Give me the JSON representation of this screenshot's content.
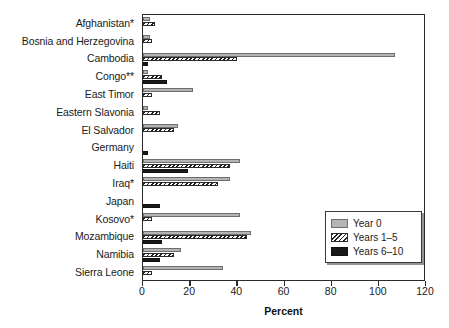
{
  "chart_data": {
    "type": "bar",
    "orientation": "horizontal",
    "title": "",
    "xlabel": "Percent",
    "ylabel": "",
    "xlim": [
      0,
      120
    ],
    "xticks": [
      0,
      20,
      40,
      60,
      80,
      100,
      120
    ],
    "grid": false,
    "legend_position": "bottom-right",
    "categories": [
      "Afghanistan*",
      "Bosnia and Herzegovina",
      "Cambodia",
      "Congo**",
      "East Timor",
      "Eastern Slavonia",
      "El Salvador",
      "Germany",
      "Haiti",
      "Iraq*",
      "Japan",
      "Kosovo*",
      "Mozambique",
      "Namibia",
      "Sierra Leone"
    ],
    "series": [
      {
        "name": "Year 0",
        "color": "#b4b4b4",
        "values": [
          3,
          3,
          107,
          2,
          21,
          2,
          15,
          0,
          41,
          37,
          0,
          41,
          46,
          16,
          34
        ]
      },
      {
        "name": "Years 1–5",
        "color": "#1e1e1e",
        "pattern": "diagonal-hatch",
        "values": [
          5,
          4,
          40,
          8,
          4,
          7,
          13,
          0,
          37,
          32,
          0,
          4,
          44,
          13,
          4
        ]
      },
      {
        "name": "Years 6–10",
        "color": "#191919",
        "values": [
          0,
          0,
          2,
          10,
          0,
          0,
          0,
          2,
          19,
          0,
          7,
          0,
          8,
          7,
          0
        ]
      }
    ]
  },
  "legend": {
    "items": [
      {
        "label": "Year 0"
      },
      {
        "label": "Years 1–5"
      },
      {
        "label": "Years 6–10"
      }
    ]
  },
  "axis": {
    "x_title": "Percent",
    "x_tick_labels": [
      "0",
      "20",
      "40",
      "60",
      "80",
      "100",
      "120"
    ]
  }
}
